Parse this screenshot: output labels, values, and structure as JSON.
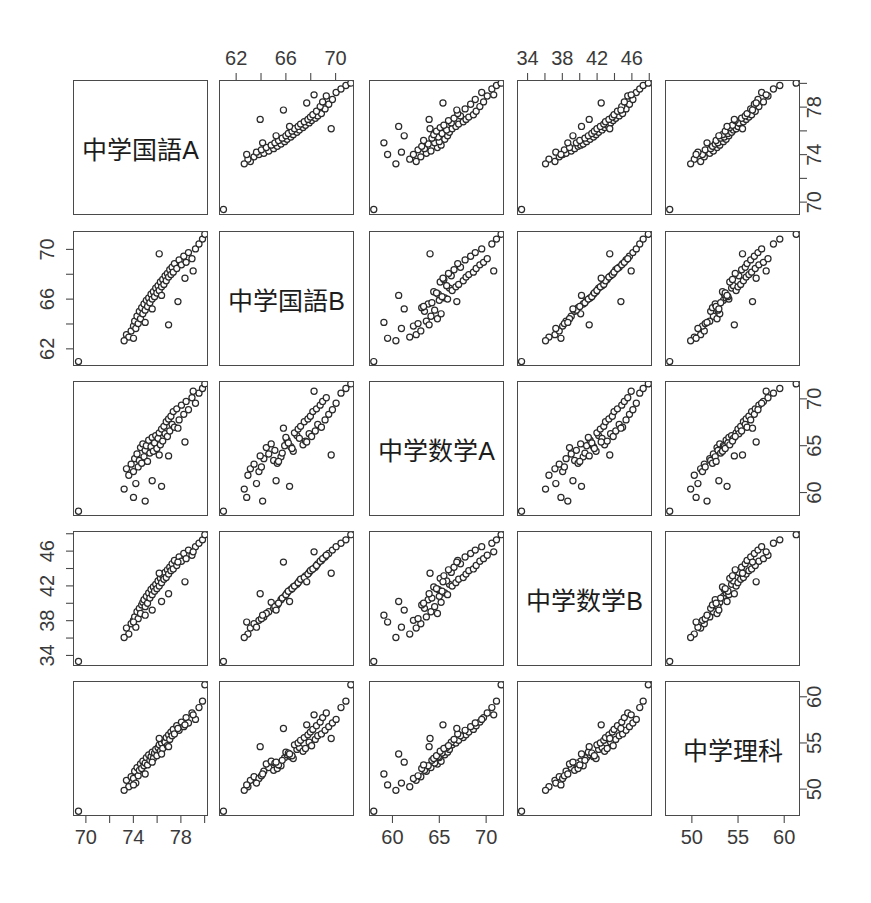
{
  "figure": {
    "type": "scatterplot-matrix",
    "n_variables": 5,
    "n_points": 61,
    "marker": "open-circle",
    "marker_color": "#2a2a2a",
    "panel_border_color": "#4a4a4a",
    "background": "#ffffff"
  },
  "variables": [
    {
      "key": "kokugoA",
      "label": "中学国語A",
      "min": 69.0,
      "max": 80.2,
      "ticks": [
        70,
        72,
        74,
        76,
        78,
        80
      ],
      "labeled_ticks": [
        70,
        74,
        78
      ]
    },
    {
      "key": "kokugoB",
      "label": "中学国語B",
      "min": 60.7,
      "max": 71.4,
      "ticks": [
        62,
        64,
        66,
        68,
        70
      ],
      "labeled_ticks": [
        62,
        66,
        70
      ]
    },
    {
      "key": "suugakuA",
      "label": "中学数学A",
      "min": 57.6,
      "max": 71.8,
      "ticks": [
        60,
        65,
        70
      ],
      "labeled_ticks": [
        60,
        65,
        70
      ]
    },
    {
      "key": "suugakuB",
      "label": "中学数学B",
      "min": 32.9,
      "max": 48.2,
      "ticks": [
        34,
        36,
        38,
        40,
        42,
        44,
        46,
        48
      ],
      "labeled_ticks": [
        34,
        38,
        42,
        46
      ]
    },
    {
      "key": "rika",
      "label": "中学理科",
      "min": 47.2,
      "max": 61.6,
      "ticks": [
        50,
        55,
        60
      ],
      "labeled_ticks": [
        50,
        55,
        60
      ]
    }
  ],
  "axes": {
    "top_columns": [
      {
        "column": 2,
        "variable": "kokugoB",
        "labels": [
          "62",
          "66",
          "70"
        ]
      },
      {
        "column": 4,
        "variable": "suugakuB",
        "labels": [
          "34",
          "38",
          "42",
          "46"
        ]
      }
    ],
    "bottom_columns": [
      {
        "column": 1,
        "variable": "kokugoA",
        "labels": [
          "70",
          "74",
          "78"
        ]
      },
      {
        "column": 3,
        "variable": "suugakuA",
        "labels": [
          "60",
          "65",
          "70"
        ]
      },
      {
        "column": 5,
        "variable": "rika",
        "labels": [
          "50",
          "55",
          "60"
        ]
      }
    ],
    "left_rows": [
      {
        "row": 2,
        "variable": "kokugoB",
        "labels": [
          "62",
          "66",
          "70"
        ]
      },
      {
        "row": 4,
        "variable": "suugakuB",
        "labels": [
          "34",
          "38",
          "42",
          "46"
        ]
      }
    ],
    "right_rows": [
      {
        "row": 1,
        "variable": "kokugoA",
        "labels": [
          "70",
          "74",
          "78"
        ]
      },
      {
        "row": 3,
        "variable": "suugakuA",
        "labels": [
          "60",
          "65",
          "70"
        ]
      },
      {
        "row": 5,
        "variable": "rika",
        "labels": [
          "50",
          "55",
          "60"
        ]
      }
    ]
  },
  "chart_data": {
    "type": "scatter",
    "title": "",
    "xlabel": "",
    "ylabel": "",
    "grid": false,
    "legend": "none",
    "layout": "pairs-matrix 5x5, diagonal shows variable name",
    "columns": [
      "中学国語A",
      "中学国語B",
      "中学数学A",
      "中学数学B",
      "中学理科"
    ],
    "axis_ranges": {
      "中学国語A": [
        69.0,
        80.2
      ],
      "中学国語B": [
        60.7,
        71.4
      ],
      "中学数学A": [
        57.6,
        71.8
      ],
      "中学数学B": [
        32.9,
        48.2
      ],
      "中学理科": [
        47.2,
        61.6
      ]
    },
    "correlations": {
      "中学国語A-中学国語B": 0.93,
      "中学国語A-中学数学A": 0.78,
      "中学国語A-中学数学B": 0.84,
      "中学国語A-中学理科": 0.85,
      "中学国語B-中学数学A": 0.8,
      "中学国語B-中学数学B": 0.86,
      "中学国語B-中学理科": 0.84,
      "中学数学A-中学数学B": 0.92,
      "中学数学A-中学理科": 0.83,
      "中学数学B-中学理科": 0.88
    },
    "points": [
      [
        69.3,
        60.9,
        57.9,
        33.2,
        47.5
      ],
      [
        73.4,
        63.1,
        62.5,
        37.1,
        50.9
      ],
      [
        73.6,
        62.9,
        61.8,
        36.4,
        50.2
      ],
      [
        73.8,
        63.4,
        63.0,
        37.6,
        51.3
      ],
      [
        74.0,
        63.8,
        62.2,
        38.0,
        51.1
      ],
      [
        74.1,
        64.2,
        63.6,
        38.4,
        51.9
      ],
      [
        74.2,
        63.6,
        60.9,
        37.2,
        50.6
      ],
      [
        74.3,
        64.6,
        64.1,
        39.0,
        52.3
      ],
      [
        74.4,
        64.0,
        62.7,
        38.2,
        51.4
      ],
      [
        74.5,
        65.0,
        63.4,
        39.4,
        52.0
      ],
      [
        74.6,
        64.4,
        64.8,
        38.8,
        52.7
      ],
      [
        74.7,
        65.3,
        63.1,
        39.8,
        52.2
      ],
      [
        74.8,
        64.8,
        65.2,
        40.1,
        53.0
      ],
      [
        74.9,
        65.6,
        63.8,
        40.4,
        52.5
      ],
      [
        75.0,
        65.1,
        64.5,
        39.6,
        52.8
      ],
      [
        75.1,
        65.9,
        65.0,
        40.8,
        53.4
      ],
      [
        75.2,
        65.4,
        63.3,
        40.0,
        52.6
      ],
      [
        75.3,
        66.1,
        65.6,
        41.2,
        53.7
      ],
      [
        75.4,
        65.7,
        64.2,
        40.6,
        53.1
      ],
      [
        75.5,
        66.4,
        64.9,
        41.6,
        53.5
      ],
      [
        75.6,
        66.0,
        65.9,
        41.0,
        54.0
      ],
      [
        75.7,
        66.6,
        64.4,
        41.9,
        53.3
      ],
      [
        75.8,
        66.2,
        65.3,
        41.4,
        53.9
      ],
      [
        75.9,
        66.9,
        66.1,
        42.2,
        54.3
      ],
      [
        76.0,
        66.5,
        64.7,
        41.7,
        53.6
      ],
      [
        76.1,
        67.1,
        65.8,
        42.6,
        54.5
      ],
      [
        76.2,
        66.7,
        66.4,
        42.0,
        54.8
      ],
      [
        76.3,
        67.4,
        65.1,
        42.9,
        54.1
      ],
      [
        76.4,
        67.0,
        66.8,
        42.4,
        55.0
      ],
      [
        76.5,
        67.6,
        65.5,
        43.2,
        54.4
      ],
      [
        76.6,
        67.2,
        67.1,
        42.8,
        55.3
      ],
      [
        76.7,
        67.9,
        66.3,
        43.6,
        55.1
      ],
      [
        76.8,
        67.5,
        67.6,
        43.0,
        55.6
      ],
      [
        76.9,
        68.1,
        66.0,
        43.9,
        54.7
      ],
      [
        77.0,
        67.8,
        67.9,
        43.4,
        55.9
      ],
      [
        77.1,
        68.4,
        66.6,
        44.2,
        55.4
      ],
      [
        77.2,
        68.0,
        68.2,
        43.8,
        56.2
      ],
      [
        77.3,
        68.6,
        67.3,
        44.6,
        55.8
      ],
      [
        77.4,
        68.2,
        68.7,
        44.0,
        56.5
      ],
      [
        77.5,
        68.9,
        67.0,
        45.0,
        56.0
      ],
      [
        77.7,
        68.5,
        69.0,
        44.4,
        56.9
      ],
      [
        77.9,
        69.2,
        67.8,
        45.4,
        56.4
      ],
      [
        78.1,
        68.8,
        69.4,
        44.9,
        57.3
      ],
      [
        78.3,
        69.5,
        68.4,
        45.8,
        56.8
      ],
      [
        78.5,
        69.0,
        69.8,
        45.2,
        57.8
      ],
      [
        78.7,
        69.8,
        68.9,
        46.2,
        57.2
      ],
      [
        79.0,
        69.3,
        70.2,
        45.6,
        58.3
      ],
      [
        79.3,
        70.1,
        69.6,
        46.6,
        57.6
      ],
      [
        79.6,
        70.5,
        70.7,
        47.0,
        58.9
      ],
      [
        79.9,
        70.9,
        71.2,
        47.4,
        59.6
      ],
      [
        80.1,
        71.3,
        71.7,
        48.0,
        61.4
      ],
      [
        73.2,
        62.6,
        60.3,
        36.0,
        49.8
      ],
      [
        74.0,
        62.8,
        59.4,
        37.8,
        50.4
      ],
      [
        75.0,
        64.1,
        59.0,
        38.6,
        51.6
      ],
      [
        75.6,
        65.2,
        61.2,
        39.2,
        52.9
      ],
      [
        76.4,
        66.3,
        60.6,
        40.2,
        53.8
      ],
      [
        77.0,
        63.9,
        63.9,
        41.1,
        54.6
      ],
      [
        77.8,
        65.8,
        66.9,
        44.8,
        56.6
      ],
      [
        78.4,
        67.7,
        65.4,
        42.5,
        57.0
      ],
      [
        79.1,
        68.3,
        70.9,
        46.0,
        58.1
      ],
      [
        76.2,
        69.7,
        64.0,
        43.5,
        55.5
      ]
    ]
  }
}
